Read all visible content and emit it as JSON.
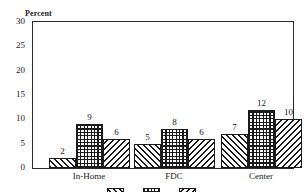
{
  "chart_data": {
    "type": "bar",
    "title": "",
    "subtitle": "",
    "xlabel": "",
    "ylabel": "Percent",
    "ylim": [
      0,
      30
    ],
    "yticks": [
      0,
      5,
      10,
      15,
      20,
      25,
      30
    ],
    "ytick_labels": [
      "0",
      "5",
      "10",
      "15",
      "20",
      "25",
      "30"
    ],
    "grid": false,
    "legend_position": "bottom",
    "categories": [
      "In-Home",
      "FDC",
      "Center"
    ],
    "series": [
      {
        "name": "Series 1",
        "pattern": "diagonal-forward-hatch",
        "values": [
          2,
          5,
          7
        ]
      },
      {
        "name": "Series 2",
        "pattern": "crosshatch-grid",
        "values": [
          9,
          8,
          12
        ]
      },
      {
        "name": "Series 3",
        "pattern": "diagonal-backward-hatch",
        "values": [
          6,
          6,
          10
        ]
      }
    ],
    "value_labels": [
      [
        "2",
        "9",
        "6"
      ],
      [
        "5",
        "8",
        "6"
      ],
      [
        "7",
        "12",
        "10"
      ]
    ],
    "colors": {
      "axis": "#2b2b2b",
      "bar_outline": "#1a1a1a",
      "bar_fill": "#ffffff",
      "hatch": "#1a1a1a",
      "background": "#ffffff",
      "text": "#1a1a1a"
    }
  },
  "axis": {
    "y_title": "Percent"
  },
  "legend": {
    "items": [
      {
        "label": "",
        "pattern": "diagonal-forward-hatch"
      },
      {
        "label": "",
        "pattern": "crosshatch-grid"
      },
      {
        "label": "",
        "pattern": "diagonal-backward-hatch"
      }
    ]
  }
}
